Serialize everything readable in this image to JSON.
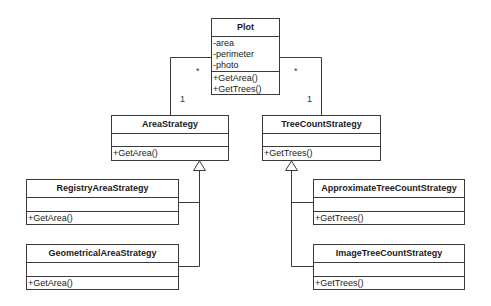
{
  "diagram": {
    "type": "UML class diagram",
    "classes": {
      "plot": {
        "name": "Plot",
        "attributes": [
          "-area",
          "-perimeter",
          "-photo"
        ],
        "operations": [
          "+GetArea()",
          "+GetTrees()"
        ]
      },
      "area_strategy": {
        "name": "AreaStrategy",
        "attributes": [],
        "operations": [
          "+GetArea()"
        ]
      },
      "tree_count_strategy": {
        "name": "TreeCountStrategy",
        "attributes": [],
        "operations": [
          "+GetTrees()"
        ]
      },
      "registry_area_strategy": {
        "name": "RegistryAreaStrategy",
        "attributes": [],
        "operations": [
          "+GetArea()"
        ]
      },
      "geometrical_area_strategy": {
        "name": "GeometricalAreaStrategy",
        "attributes": [],
        "operations": [
          "+GetArea()"
        ]
      },
      "approximate_tree_count_strategy": {
        "name": "ApproximateTreeCountStrategy",
        "attributes": [],
        "operations": [
          "+GetTrees()"
        ]
      },
      "image_tree_count_strategy": {
        "name": "ImageTreeCountStrategy",
        "attributes": [],
        "operations": [
          "+GetTrees()"
        ]
      }
    },
    "associations": [
      {
        "from": "Plot",
        "to": "AreaStrategy",
        "from_multiplicity": "*",
        "to_multiplicity": "1"
      },
      {
        "from": "Plot",
        "to": "TreeCountStrategy",
        "from_multiplicity": "*",
        "to_multiplicity": "1"
      }
    ],
    "generalizations": [
      {
        "child": "RegistryAreaStrategy",
        "parent": "AreaStrategy"
      },
      {
        "child": "GeometricalAreaStrategy",
        "parent": "AreaStrategy"
      },
      {
        "child": "ApproximateTreeCountStrategy",
        "parent": "TreeCountStrategy"
      },
      {
        "child": "ImageTreeCountStrategy",
        "parent": "TreeCountStrategy"
      }
    ],
    "line_color": "#3a3a3a"
  }
}
